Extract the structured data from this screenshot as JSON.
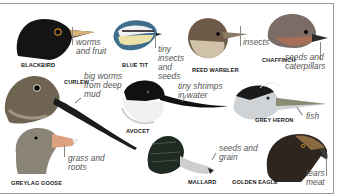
{
  "colors": {
    "frame": "#9a9a9a",
    "label": "#1a1a1a",
    "food": "#555555"
  },
  "birds": [
    {
      "name": "BLACKBIRD",
      "food": "worms\nand fruit"
    },
    {
      "name": "BLUE TIT",
      "food": "tiny\ninsects\nand\nseeds"
    },
    {
      "name": "REED WARBLER",
      "food": "insects"
    },
    {
      "name": "CHAFFINCH",
      "food": "seeds and\ncaterpillars"
    },
    {
      "name": "CURLEW",
      "food": "big worms\nfrom deep\nmud"
    },
    {
      "name": "AVOCET",
      "food": "tiny shrimps\nin water"
    },
    {
      "name": "GREY HERON",
      "food": "fish"
    },
    {
      "name": "GREYLAG GOOSE",
      "food": "grass and\nroots"
    },
    {
      "name": "MALLARD",
      "food": "seeds and\ngrain"
    },
    {
      "name": "GOLDEN EAGLE",
      "food": "tears\nmeat"
    }
  ]
}
